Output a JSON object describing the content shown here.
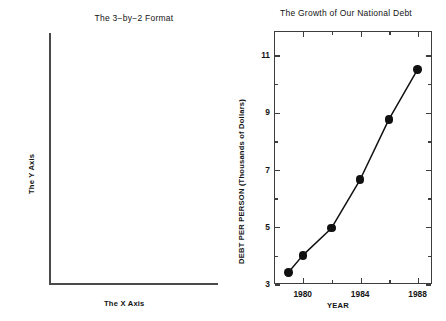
{
  "left_panel": {
    "title": "The 3−by−2 Format",
    "x_axis_label": "The X Axis",
    "y_axis_label": "The Y Axis"
  },
  "right_panel": {
    "title": "The Growth of Our National Debt",
    "x_axis_label": "YEAR",
    "y_axis_label": "DEBT PER PERSON (Thousands of Dollars)"
  },
  "colors": {
    "line": "#111111",
    "marker": "#111111",
    "frame": "#3d3d3d",
    "text": "#141414",
    "background": "#ffffff"
  },
  "chart_data": {
    "type": "line",
    "title": "The Growth of Our National Debt",
    "xlabel": "YEAR",
    "ylabel": "DEBT PER PERSON (Thousands of Dollars)",
    "xlim": [
      1978,
      1989
    ],
    "ylim": [
      3,
      11
    ],
    "grid": false,
    "legend": null,
    "xticks": [
      1980,
      1984,
      1988
    ],
    "xticklabels": [
      "1980",
      "1984",
      "1988"
    ],
    "xminorticks": [
      1978,
      1982,
      1986,
      1989
    ],
    "yticks": [
      3,
      5,
      7,
      9,
      11
    ],
    "yticklabels": [
      "3",
      "5",
      "7",
      "9",
      "11"
    ],
    "yminorticks": [
      4,
      6,
      8,
      10
    ],
    "x": [
      1979,
      1980,
      1982,
      1984,
      1986,
      1988
    ],
    "values": [
      3.4,
      4.0,
      4.95,
      6.65,
      8.75,
      10.5
    ],
    "marker": "filled-circle",
    "series": [
      {
        "name": "Debt per person",
        "x": [
          1979,
          1980,
          1982,
          1984,
          1986,
          1988
        ],
        "values": [
          3.4,
          4.0,
          4.95,
          6.65,
          8.75,
          10.5
        ]
      }
    ]
  },
  "secondary_chart": {
    "type": "empty-axes",
    "title": "The 3−by−2 Format",
    "xlabel": "The X Axis",
    "ylabel": "The Y Axis",
    "xticks": [],
    "yticks": [],
    "values": []
  }
}
